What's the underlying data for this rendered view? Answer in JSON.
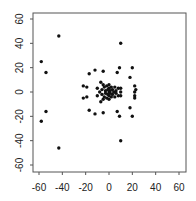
{
  "chart_data": {
    "type": "scatter",
    "title": "",
    "xlabel": "",
    "ylabel": "",
    "xlim": [
      -65,
      65
    ],
    "ylim": [
      -65,
      65
    ],
    "xticks": [
      -60,
      -40,
      -20,
      0,
      20,
      40,
      60
    ],
    "yticks": [
      -60,
      -40,
      -20,
      0,
      20,
      40,
      60
    ],
    "xtick_labels": [
      "-60",
      "-40",
      "-20",
      "0",
      "20",
      "40",
      "60"
    ],
    "ytick_labels": [
      "-60",
      "-40",
      "-20",
      "0",
      "20",
      "40",
      "60"
    ],
    "grid": false,
    "legend": null,
    "marker_color": "#111111",
    "points": [
      [
        -43,
        46
      ],
      [
        -43,
        -46
      ],
      [
        10,
        40
      ],
      [
        10,
        -40
      ],
      [
        -58,
        25
      ],
      [
        -58,
        -24
      ],
      [
        -54,
        16
      ],
      [
        -54,
        -16
      ],
      [
        9,
        20
      ],
      [
        9,
        -20
      ],
      [
        20,
        20
      ],
      [
        20,
        -20
      ],
      [
        -17,
        15
      ],
      [
        -17,
        -15
      ],
      [
        -12,
        18
      ],
      [
        -12,
        -18
      ],
      [
        -5,
        17
      ],
      [
        -5,
        -17
      ],
      [
        7,
        16
      ],
      [
        7,
        -16
      ],
      [
        18,
        12
      ],
      [
        18,
        -13
      ],
      [
        -22,
        5
      ],
      [
        -22,
        -5
      ],
      [
        -19,
        4
      ],
      [
        -19,
        -4
      ],
      [
        22,
        5
      ],
      [
        23,
        2
      ],
      [
        22,
        0
      ],
      [
        22,
        -3
      ],
      [
        22,
        -5
      ],
      [
        -10,
        3
      ],
      [
        -10,
        -3
      ],
      [
        -7,
        8
      ],
      [
        -7,
        -8
      ],
      [
        -5,
        6
      ],
      [
        -5,
        -6
      ],
      [
        -3,
        1
      ],
      [
        -3,
        -1
      ],
      [
        -6,
        2
      ],
      [
        -6,
        -2
      ],
      [
        -4,
        4
      ],
      [
        -4,
        -4
      ],
      [
        0,
        6
      ],
      [
        0,
        -6
      ],
      [
        0,
        3
      ],
      [
        0,
        -3
      ],
      [
        0,
        0
      ],
      [
        1,
        1
      ],
      [
        1,
        -1
      ],
      [
        2,
        4
      ],
      [
        2,
        -4
      ],
      [
        3,
        2
      ],
      [
        3,
        -2
      ],
      [
        4,
        0
      ],
      [
        -1,
        2
      ],
      [
        -1,
        -2
      ],
      [
        -2,
        5
      ],
      [
        -2,
        -5
      ],
      [
        5,
        4
      ],
      [
        5,
        -4
      ],
      [
        6,
        1
      ],
      [
        6,
        -1
      ],
      [
        8,
        3
      ],
      [
        8,
        -3
      ],
      [
        10,
        3
      ],
      [
        10,
        -3
      ],
      [
        10,
        0
      ],
      [
        -8,
        0
      ]
    ]
  }
}
